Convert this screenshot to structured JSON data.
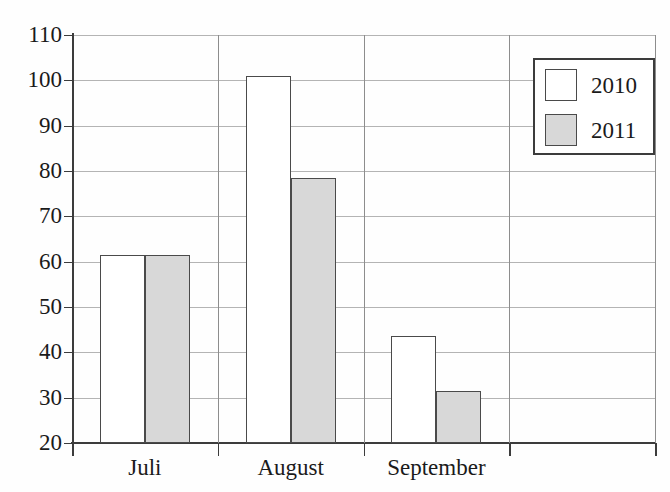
{
  "chart_data": {
    "type": "bar",
    "title": "",
    "xlabel": "",
    "ylabel": "",
    "ylim": [
      20,
      110
    ],
    "ytick_step": 10,
    "yticks": [
      110,
      100,
      90,
      80,
      70,
      60,
      50,
      40,
      30,
      20
    ],
    "ytick_labels": [
      "110",
      "100",
      "90",
      "80",
      "70",
      "60",
      "50",
      "40",
      "30",
      "20"
    ],
    "categories": [
      "Juli",
      "August",
      "September",
      ""
    ],
    "grid": true,
    "legend_position": "upper right",
    "series": [
      {
        "name": "2010",
        "color": "#ffffff",
        "edge_color": "#4a4a4a",
        "values": [
          61.5,
          101.0,
          43.7,
          null
        ]
      },
      {
        "name": "2011",
        "color": "#d8d8d8",
        "edge_color": "#4a4a4a",
        "values": [
          61.5,
          78.5,
          31.5,
          null
        ]
      }
    ]
  },
  "legend": {
    "entries": [
      {
        "label": "2010"
      },
      {
        "label": "2011"
      }
    ]
  },
  "axes": {
    "y_labels": [
      "110",
      "100",
      "90",
      "80",
      "70",
      "60",
      "50",
      "40",
      "30",
      "20"
    ],
    "x_labels": [
      "Juli",
      "August",
      "September",
      ""
    ]
  }
}
